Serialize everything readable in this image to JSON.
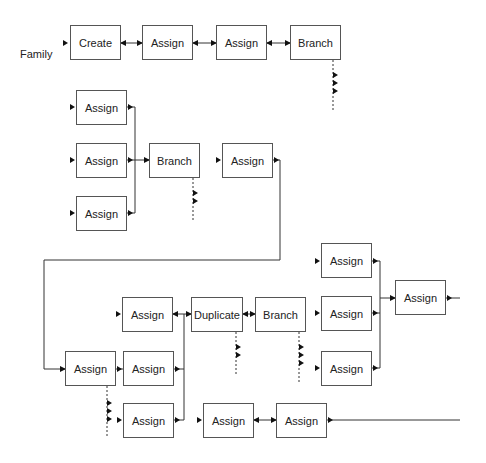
{
  "diagram": {
    "row_label": "Family",
    "nodes": [
      {
        "id": "n1",
        "label": "Create",
        "x": 70,
        "y": 25,
        "w": 51,
        "h": 35
      },
      {
        "id": "n2",
        "label": "Assign",
        "x": 142,
        "y": 25,
        "w": 51,
        "h": 35
      },
      {
        "id": "n3",
        "label": "Assign",
        "x": 216,
        "y": 25,
        "w": 51,
        "h": 35
      },
      {
        "id": "n4",
        "label": "Branch",
        "x": 290,
        "y": 25,
        "w": 51,
        "h": 35
      },
      {
        "id": "n5",
        "label": "Assign",
        "x": 76,
        "y": 90,
        "w": 51,
        "h": 35
      },
      {
        "id": "n6",
        "label": "Assign",
        "x": 76,
        "y": 143,
        "w": 51,
        "h": 35
      },
      {
        "id": "n7",
        "label": "Assign",
        "x": 76,
        "y": 196,
        "w": 51,
        "h": 35
      },
      {
        "id": "n8",
        "label": "Branch",
        "x": 149,
        "y": 143,
        "w": 51,
        "h": 35
      },
      {
        "id": "n9",
        "label": "Assign",
        "x": 222,
        "y": 143,
        "w": 51,
        "h": 35
      },
      {
        "id": "n10",
        "label": "Assign",
        "x": 321,
        "y": 243,
        "w": 51,
        "h": 35
      },
      {
        "id": "n11",
        "label": "Assign",
        "x": 122,
        "y": 297,
        "w": 51,
        "h": 35
      },
      {
        "id": "n12",
        "label": "Duplicate",
        "x": 191,
        "y": 297,
        "w": 52,
        "h": 35
      },
      {
        "id": "n13",
        "label": "Branch",
        "x": 255,
        "y": 297,
        "w": 51,
        "h": 35
      },
      {
        "id": "n14",
        "label": "Assign",
        "x": 321,
        "y": 296,
        "w": 51,
        "h": 35
      },
      {
        "id": "n15",
        "label": "Assign",
        "x": 395,
        "y": 280,
        "w": 51,
        "h": 35
      },
      {
        "id": "n16",
        "label": "Assign",
        "x": 65,
        "y": 351,
        "w": 51,
        "h": 35
      },
      {
        "id": "n16b",
        "label": "Assign",
        "x": 123,
        "y": 351,
        "w": 51,
        "h": 35
      },
      {
        "id": "n17",
        "label": "Assign",
        "x": 321,
        "y": 351,
        "w": 51,
        "h": 35
      },
      {
        "id": "n18",
        "label": "Assign",
        "x": 123,
        "y": 403,
        "w": 51,
        "h": 35
      },
      {
        "id": "n19",
        "label": "Assign",
        "x": 203,
        "y": 403,
        "w": 51,
        "h": 35
      },
      {
        "id": "n20",
        "label": "Assign",
        "x": 276,
        "y": 403,
        "w": 51,
        "h": 35
      }
    ]
  }
}
